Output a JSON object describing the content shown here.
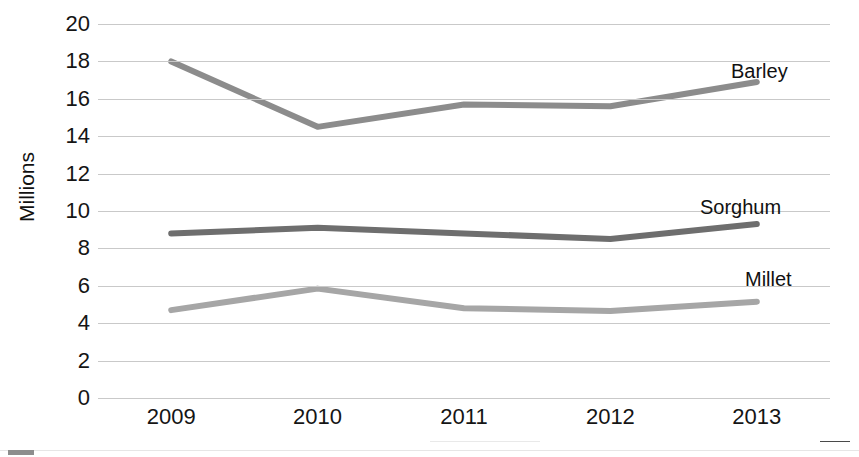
{
  "chart_data": {
    "type": "line",
    "title": "",
    "xlabel": "",
    "ylabel": "Millions",
    "x": [
      "2009",
      "2010",
      "2011",
      "2012",
      "2013"
    ],
    "categories": [
      "2009",
      "2010",
      "2011",
      "2012",
      "2013"
    ],
    "ylim": [
      0,
      20
    ],
    "ytick_step": 2,
    "yticks": [
      "20",
      "18",
      "16",
      "14",
      "12",
      "10",
      "8",
      "6",
      "4",
      "2",
      "0"
    ],
    "grid": "horizontal",
    "legend_position": "direct-labels-right",
    "series": [
      {
        "name": "Barley",
        "color": "#8c8c8c",
        "values": [
          18.0,
          14.5,
          15.7,
          15.6,
          16.9
        ],
        "label": "Barley"
      },
      {
        "name": "Sorghum",
        "color": "#6e6e6e",
        "values": [
          8.8,
          9.1,
          8.8,
          8.5,
          9.3
        ],
        "label": "Sorghum"
      },
      {
        "name": "Millet",
        "color": "#a6a6a6",
        "values": [
          4.7,
          5.85,
          4.8,
          4.65,
          5.15
        ],
        "label": "Millet"
      }
    ]
  },
  "axis": {
    "y_title": "Millions",
    "y_ticks": [
      "20",
      "18",
      "16",
      "14",
      "12",
      "10",
      "8",
      "6",
      "4",
      "2",
      "0"
    ],
    "x_ticks": [
      "2009",
      "2010",
      "2011",
      "2012",
      "2013"
    ]
  },
  "labels": {
    "barley": "Barley",
    "sorghum": "Sorghum",
    "millet": "Millet"
  }
}
